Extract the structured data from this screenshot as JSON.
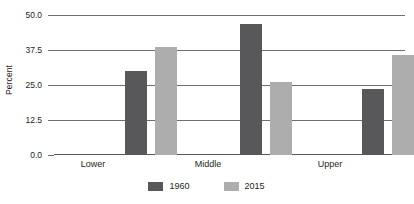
{
  "chart_data": {
    "type": "bar",
    "title": "",
    "xlabel": "",
    "ylabel": "Percent",
    "categories": [
      "Lower",
      "Middle",
      "Upper"
    ],
    "series": [
      {
        "name": "1960",
        "color": "#58585a",
        "values": [
          30.4,
          47.1,
          23.9
        ]
      },
      {
        "name": "2015",
        "color": "#adadad",
        "values": [
          38.9,
          26.1,
          36.1
        ]
      }
    ],
    "ylim": [
      0.0,
      50.0
    ],
    "yticks": [
      0.0,
      12.5,
      25.0,
      37.5,
      50.0
    ],
    "ytick_labels": [
      "0.0",
      "12.5",
      "25.0",
      "37.5",
      "50.0"
    ],
    "grid": true,
    "legend_position": "bottom"
  },
  "axis": {
    "y_title": "Percent",
    "ytick_labels": [
      "50.0",
      "37.5",
      "25.0",
      "12.5",
      "0.0"
    ],
    "category_labels": [
      "Lower",
      "Middle",
      "Upper"
    ]
  },
  "legend": {
    "items": [
      {
        "label": "1960"
      },
      {
        "label": "2015"
      }
    ]
  }
}
